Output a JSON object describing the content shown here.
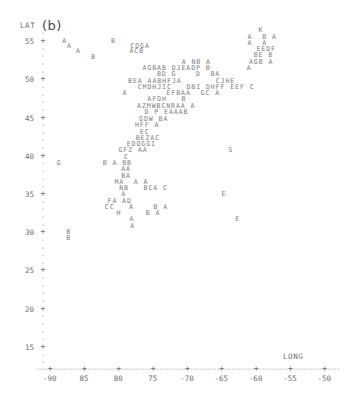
{
  "panel": {
    "label": "(b)"
  },
  "axes": {
    "y": {
      "title": "LAT",
      "ticks": [
        55,
        50,
        45,
        40,
        35,
        30,
        25,
        20,
        15
      ],
      "range": [
        12.5,
        57.5
      ]
    },
    "x": {
      "title": "LONG",
      "ticks": [
        "-90",
        "85",
        "80",
        "75",
        "-70",
        "-65",
        "-60",
        "-55",
        "-50"
      ],
      "tick_values": [
        -90,
        -85,
        -80,
        -75,
        -70,
        -65,
        -60,
        -55,
        -50
      ],
      "range": [
        -92,
        -48
      ]
    }
  },
  "chart_data": {
    "type": "scatter",
    "title": "(b)",
    "xlabel": "LONG",
    "ylabel": "LAT",
    "xlim": [
      -92,
      -48
    ],
    "ylim": [
      12.5,
      57.5
    ],
    "grid": false,
    "legend": "none",
    "rows": [
      {
        "lat": 55.0,
        "lon_start": -89.2,
        "text": "A         B"
      },
      {
        "lat": 54.3,
        "lon_start": -88.5,
        "text": "A            CDGA"
      },
      {
        "lat": 53.6,
        "lon_start": -87.2,
        "text": "A          ACB"
      },
      {
        "lat": 52.9,
        "lon_start": -85.0,
        "text": "B"
      },
      {
        "lat": 56.4,
        "lon_start": -60.6,
        "text": "K"
      },
      {
        "lat": 55.5,
        "lon_start": -62.2,
        "text": "A  B A"
      },
      {
        "lat": 54.7,
        "lon_start": -62.2,
        "text": "A  A"
      },
      {
        "lat": 53.9,
        "lon_start": -60.9,
        "text": "EEDF"
      },
      {
        "lat": 53.1,
        "lon_start": -61.3,
        "text": "BE B"
      },
      {
        "lat": 52.2,
        "lon_start": -71.8,
        "text": "A NB A"
      },
      {
        "lat": 52.2,
        "lon_start": -62.0,
        "text": "AGB A"
      },
      {
        "lat": 51.4,
        "lon_start": -77.5,
        "text": "AGBAB DJEADP B"
      },
      {
        "lat": 51.4,
        "lon_start": -62.3,
        "text": "A"
      },
      {
        "lat": 50.6,
        "lon_start": -75.4,
        "text": "BD G    D  BA"
      },
      {
        "lat": 49.7,
        "lon_start": -79.6,
        "text": "BEA AABHFJA       CJHE"
      },
      {
        "lat": 48.9,
        "lon_start": -78.2,
        "text": "CMDHJIC   DBI DHFF EEF C"
      },
      {
        "lat": 48.1,
        "lon_start": -80.4,
        "text": "A        EFBAA  GC A"
      },
      {
        "lat": 47.3,
        "lon_start": -76.8,
        "text": "AFOH   B"
      },
      {
        "lat": 46.4,
        "lon_start": -78.3,
        "text": "AZMWBCNRAA A"
      },
      {
        "lat": 45.6,
        "lon_start": -77.2,
        "text": "D P EAAAB"
      },
      {
        "lat": 44.8,
        "lon_start": -78.0,
        "text": "GDW BA"
      },
      {
        "lat": 44.0,
        "lon_start": -78.6,
        "text": "HFF A"
      },
      {
        "lat": 43.1,
        "lon_start": -77.9,
        "text": "EC"
      },
      {
        "lat": 42.3,
        "lon_start": -78.5,
        "text": "BEZAC"
      },
      {
        "lat": 41.5,
        "lon_start": -79.8,
        "text": "EDOGGI"
      },
      {
        "lat": 40.7,
        "lon_start": -81.0,
        "text": "GFZ AA"
      },
      {
        "lat": 40.7,
        "lon_start": -65.0,
        "text": "S"
      },
      {
        "lat": 39.8,
        "lon_start": -80.2,
        "text": "C"
      },
      {
        "lat": 39.0,
        "lon_start": -83.3,
        "text": "B A BB"
      },
      {
        "lat": 39.0,
        "lon_start": -90.0,
        "text": "G"
      },
      {
        "lat": 38.2,
        "lon_start": -80.6,
        "text": "AA"
      },
      {
        "lat": 37.3,
        "lon_start": -80.6,
        "text": "BA"
      },
      {
        "lat": 36.5,
        "lon_start": -81.6,
        "text": "MA  A A"
      },
      {
        "lat": 35.7,
        "lon_start": -80.9,
        "text": "NB   BCA C"
      },
      {
        "lat": 34.9,
        "lon_start": -80.6,
        "text": "A"
      },
      {
        "lat": 34.9,
        "lon_start": -66.0,
        "text": "E"
      },
      {
        "lat": 34.0,
        "lon_start": -82.6,
        "text": "FA AD"
      },
      {
        "lat": 33.2,
        "lon_start": -83.0,
        "text": "CC   A    B A"
      },
      {
        "lat": 32.4,
        "lon_start": -81.3,
        "text": "H     B A"
      },
      {
        "lat": 31.6,
        "lon_start": -79.4,
        "text": "A"
      },
      {
        "lat": 31.6,
        "lon_start": -64.0,
        "text": "E"
      },
      {
        "lat": 30.7,
        "lon_start": -79.3,
        "text": "A"
      },
      {
        "lat": 30.0,
        "lon_start": -88.6,
        "text": "B"
      },
      {
        "lat": 29.2,
        "lon_start": -88.6,
        "text": "B"
      }
    ]
  }
}
